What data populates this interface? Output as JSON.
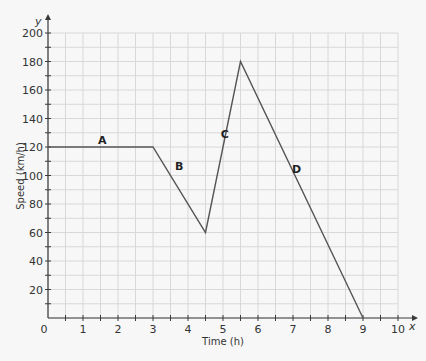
{
  "chart_data": {
    "type": "line",
    "title": "",
    "xlabel": "Time (h)",
    "ylabel": "Speed (km/h)",
    "x_axis_letter": "x",
    "y_axis_letter": "y",
    "xlim": [
      0,
      10
    ],
    "ylim": [
      0,
      200
    ],
    "grid": true,
    "x_ticks": [
      0,
      1,
      2,
      3,
      4,
      5,
      6,
      7,
      8,
      9,
      10
    ],
    "y_ticks": [
      20,
      40,
      60,
      80,
      100,
      120,
      140,
      160,
      180,
      200
    ],
    "series": [
      {
        "name": "speed",
        "x": [
          0,
          3,
          4.5,
          5.5,
          9
        ],
        "y": [
          120,
          120,
          60,
          180,
          0
        ]
      }
    ],
    "annotations": [
      {
        "text": "A",
        "x": 1.55,
        "y": 122
      },
      {
        "text": "B",
        "x": 3.75,
        "y": 104
      },
      {
        "text": "C",
        "x": 5.05,
        "y": 126
      },
      {
        "text": "D",
        "x": 7.1,
        "y": 102
      }
    ],
    "colors": {
      "line": "#555555",
      "grid": "#d8d8d8",
      "axis": "#3a3a3a",
      "background": "#f7f7f7"
    }
  }
}
